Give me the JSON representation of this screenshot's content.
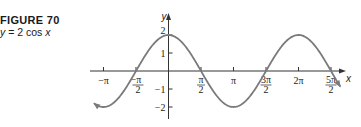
{
  "figure": {
    "title": "FIGURE 70",
    "equation_prefix": "y",
    "equation_text": " = 2 cos ",
    "equation_var": "x"
  },
  "chart_data": {
    "type": "line",
    "title": "FIGURE 70",
    "subtitle": "y = 2 cos x",
    "function": "y = 2cos(x)",
    "xlabel": "x",
    "ylabel": "y",
    "xlim": [
      -3.6,
      8.3
    ],
    "ylim": [
      -2.4,
      2.6
    ],
    "x_ticks": [
      {
        "value": -3.1416,
        "label": "−π"
      },
      {
        "value": -1.5708,
        "label": "−π/2"
      },
      {
        "value": 1.5708,
        "label": "π/2"
      },
      {
        "value": 3.1416,
        "label": "π"
      },
      {
        "value": 4.7124,
        "label": "3π/2"
      },
      {
        "value": 6.2832,
        "label": "2π"
      },
      {
        "value": 7.854,
        "label": "5π/2"
      }
    ],
    "y_ticks": [
      {
        "value": 2,
        "label": "2"
      },
      {
        "value": 1,
        "label": "1"
      },
      {
        "value": -1,
        "label": "−1"
      },
      {
        "value": -2,
        "label": "−2"
      }
    ],
    "series": [
      {
        "name": "2cos x",
        "x": [
          -3.6,
          -3.1416,
          -1.5708,
          0,
          1.5708,
          3.1416,
          4.7124,
          6.2832,
          7.854,
          8.3
        ],
        "y": [
          -1.79,
          -2,
          0,
          2,
          0,
          -2,
          0,
          2,
          0,
          -0.87
        ]
      }
    ],
    "grid": false,
    "legend": "none",
    "curve_color": "#7a7a7a",
    "axis_color": "#333333"
  }
}
